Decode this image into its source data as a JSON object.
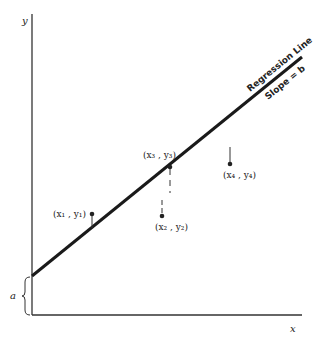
{
  "diagram": {
    "axis_x_label": "x",
    "axis_y_label": "y",
    "intercept_label": "a",
    "regression_line_label": "Regression Line",
    "slope_label": "Slope = b",
    "points": [
      {
        "name": "point-1",
        "label": "(x₁ , y₁)"
      },
      {
        "name": "point-2",
        "label": "(x₂ , y₂)"
      },
      {
        "name": "point-3",
        "label": "(x₃ , y₃)"
      },
      {
        "name": "point-4",
        "label": "(x₄ , y₄)"
      }
    ]
  },
  "colors": {
    "ink": "#222222",
    "background": "#ffffff"
  }
}
